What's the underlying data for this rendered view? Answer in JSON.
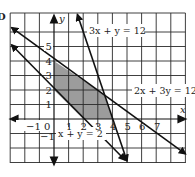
{
  "figure": {
    "corner_mark": "D",
    "axes": {
      "x_label": "x",
      "y_label": "y",
      "x_ticks": [
        "−1",
        "0",
        "1",
        "2",
        "3",
        "4",
        "5",
        "6",
        "7"
      ],
      "y_ticks": [
        "5",
        "4",
        "3",
        "2",
        "1",
        "−1"
      ],
      "x_range": [
        -3,
        9
      ],
      "y_range": [
        -3,
        7.3
      ],
      "grid": true,
      "grid_step": 1
    },
    "lines": [
      {
        "equation": "3x + y = 12",
        "from": [
          1.6,
          7.2
        ],
        "to": [
          5,
          -3
        ]
      },
      {
        "equation": "2x + 3y = 12",
        "from": [
          -2.9,
          6.3
        ],
        "to": [
          9,
          -2.4
        ]
      },
      {
        "equation": "x + y = 2",
        "from": [
          -2.9,
          5.1
        ],
        "to": [
          5,
          -3
        ]
      }
    ],
    "feasible_region": {
      "vertices": [
        [
          0,
          2
        ],
        [
          0,
          4
        ],
        [
          3.43,
          1.71
        ],
        [
          4,
          0
        ],
        [
          2,
          0
        ]
      ],
      "fill_color": "#9c9c9c"
    },
    "colors": {
      "grid": "#2a2a2a",
      "line": "#111111",
      "shade": "#9c9c9c"
    }
  }
}
